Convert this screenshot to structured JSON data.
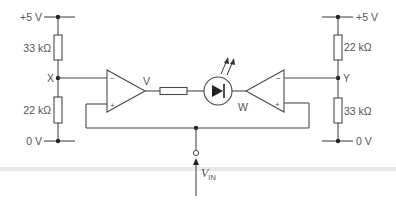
{
  "diagram": {
    "type": "window comparator circuit with LED indicator",
    "left_divider": {
      "top_rail": "+5 V",
      "upper_resistor": "33 kΩ",
      "node": "X",
      "lower_resistor": "22 kΩ",
      "bottom_rail": "0 V"
    },
    "right_divider": {
      "top_rail": "+5 V",
      "upper_resistor": "22 kΩ",
      "node": "Y",
      "lower_resistor": "33 kΩ",
      "bottom_rail": "0 V"
    },
    "left_opamp": {
      "inverting": "−",
      "non_inverting": "+",
      "output_label": "V"
    },
    "right_opamp": {
      "inverting": "−",
      "non_inverting": "+",
      "output_label": "W"
    },
    "input": {
      "label_main": "V",
      "label_sub": "IN"
    },
    "components": [
      "series resistor",
      "LED (light-emitting diode)"
    ]
  }
}
